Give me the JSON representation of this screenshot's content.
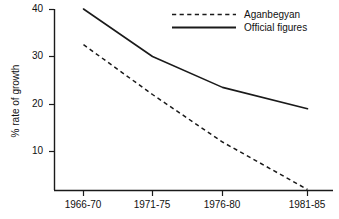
{
  "chart_data": {
    "type": "line",
    "title": "",
    "xlabel": "",
    "ylabel": "% rate of growth",
    "categories": [
      "1966-70",
      "1971-75",
      "1976-80",
      "1981-85"
    ],
    "ylim": [
      0,
      40
    ],
    "yticks": [
      10,
      20,
      30,
      40
    ],
    "ytick_labels": [
      "10",
      "20",
      "30",
      "40"
    ],
    "grid": false,
    "legend_position": "top-right",
    "series": [
      {
        "name": "Aganbegyan",
        "style": "dashed",
        "color": "#1a1a1a",
        "values": [
          32.5,
          22,
          12,
          2
        ]
      },
      {
        "name": "Official figures",
        "style": "solid",
        "color": "#1a1a1a",
        "values": [
          40,
          30,
          23.5,
          19
        ]
      }
    ]
  },
  "axis": {
    "y_label": "% rate of growth",
    "y_tick_0": "10",
    "y_tick_1": "20",
    "y_tick_2": "30",
    "y_tick_3": "40",
    "x_tick_0": "1966-70",
    "x_tick_1": "1971-75",
    "x_tick_2": "1976-80",
    "x_tick_3": "1981-85"
  },
  "legend": {
    "entry_0_label": "Aganbegyan",
    "entry_1_label": "Official figures"
  }
}
